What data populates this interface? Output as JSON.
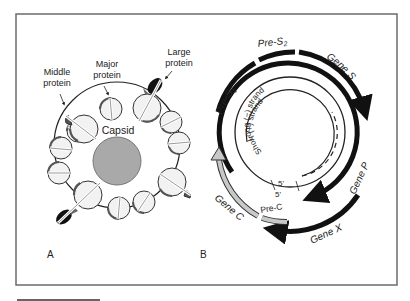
{
  "panel_a": {
    "label": "A",
    "center_label": "Capsid",
    "callouts": {
      "middle_protein": [
        "Middle",
        "protein"
      ],
      "major_protein": [
        "Major",
        "protein"
      ],
      "large_protein": [
        "Large",
        "protein"
      ]
    }
  },
  "panel_b": {
    "label": "B",
    "strands": {
      "long": "Long (−) strand",
      "short": "Short (+) strand"
    },
    "five_prime_a": "5'",
    "five_prime_b": "5'",
    "genes": {
      "pre_s1": "Pre-S",
      "pre_s1_sub": "1",
      "pre_s2": "Pre-S",
      "pre_s2_sub": "2",
      "gene_s": "Gene S",
      "gene_p": "Gene P",
      "gene_x": "Gene X",
      "gene_c": "Gene C",
      "pre_c": "Pre-C"
    }
  },
  "colors": {
    "frame": "#6b6b6b",
    "capsid_fill": "#a9a9a9",
    "particle_fill": "#f2f2f2",
    "dark": "#111111",
    "gene_c_fill": "#c8c8c8"
  }
}
